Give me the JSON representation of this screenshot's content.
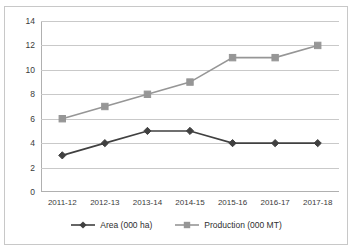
{
  "chart_data": {
    "type": "line",
    "title": "",
    "xlabel": "",
    "ylabel": "",
    "categories": [
      "2011-12",
      "2012-13",
      "2013-14",
      "2014-15",
      "2015-16",
      "2016-17",
      "2017-18"
    ],
    "series": [
      {
        "name": "Area (000 ha)",
        "values": [
          3,
          4,
          5,
          5,
          4,
          4,
          4
        ],
        "color": "#404040",
        "marker": "diamond"
      },
      {
        "name": "Production (000 MT)",
        "values": [
          6,
          7,
          8,
          9,
          11,
          11,
          12
        ],
        "color": "#969696",
        "marker": "square"
      }
    ],
    "ylim": [
      0,
      14
    ],
    "ytick_step": 2,
    "yticks": [
      "0",
      "2",
      "4",
      "6",
      "8",
      "10",
      "12",
      "14"
    ],
    "grid": true,
    "grid_axis": "y",
    "legend_position": "bottom",
    "plot_background": "#ffffff",
    "gridline_color": "#c9c9c9",
    "axis_color": "#b0b0b0",
    "border_color": "#c8c8c8"
  }
}
